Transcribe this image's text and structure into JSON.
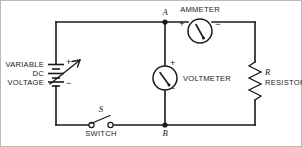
{
  "figure": {
    "background_color": "#ffffff",
    "line_color": "#1a1a1a",
    "border_color": "#b9b9b9"
  },
  "labels": {
    "ammeter": "AMMETER",
    "voltmeter": "VOLTMETER",
    "resistor_symbol": "R",
    "resistor": "RESISTOR",
    "switch_symbol": "S",
    "switch": "SWITCH",
    "node_a": "A",
    "node_b": "B",
    "source_line1": "VARIABLE",
    "source_line2": "DC",
    "source_line3": "VOLTAGE",
    "plus": "+",
    "minus": "−"
  },
  "components": [
    {
      "name": "variable-dc-voltage-source",
      "type": "battery-variable",
      "label": "VARIABLE DC VOLTAGE",
      "terminals": {
        "top": "+",
        "bottom": "−"
      }
    },
    {
      "name": "switch",
      "type": "spst-switch",
      "symbol": "S",
      "label": "SWITCH",
      "state": "open"
    },
    {
      "name": "voltmeter",
      "type": "meter",
      "label": "VOLTMETER",
      "terminals": {
        "top": "+",
        "bottom": "−"
      }
    },
    {
      "name": "ammeter",
      "type": "meter",
      "label": "AMMETER",
      "terminals": {
        "left": "+",
        "right": "−"
      }
    },
    {
      "name": "resistor",
      "type": "resistor",
      "symbol": "R",
      "label": "RESISTOR"
    }
  ],
  "nodes": [
    {
      "name": "node-a",
      "label": "A"
    },
    {
      "name": "node-b",
      "label": "B"
    }
  ]
}
